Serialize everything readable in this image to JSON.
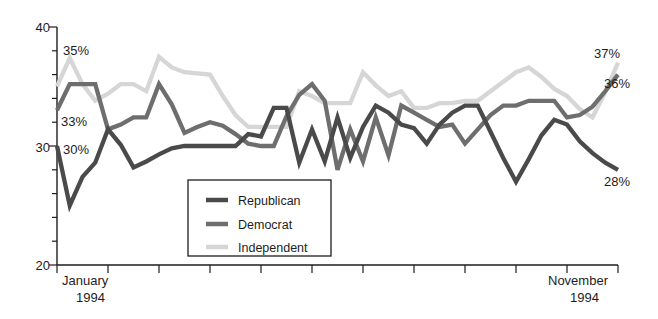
{
  "chart_data": {
    "type": "line",
    "title": "",
    "subtitle": "",
    "xlabel": "",
    "ylabel": "",
    "ylim": [
      20,
      40
    ],
    "y_major_ticks": [
      20,
      30,
      40
    ],
    "y_major_tick_labels": [
      "20",
      "30",
      "40"
    ],
    "y_minor_tick_step": 2,
    "grid": false,
    "legend_position": "inside-bottom-left",
    "x_axis_start_label_line1": "January",
    "x_axis_start_label_line2": "1994",
    "x_axis_end_label_line1": "November",
    "x_axis_end_label_line2": "1994",
    "x_tick_count": 12,
    "x": [
      0,
      1,
      2,
      3,
      4,
      5,
      6,
      7,
      8,
      9,
      10,
      11,
      12,
      13,
      14,
      15,
      16,
      17,
      18,
      19,
      20,
      21,
      22,
      23,
      24,
      25,
      26,
      27,
      28,
      29,
      30,
      31,
      32,
      33,
      34,
      35,
      36,
      37,
      38,
      39,
      40,
      41,
      42,
      43,
      44
    ],
    "series": [
      {
        "name": "Republican",
        "color": "#4a4a4a",
        "start_value": 30,
        "end_value": 28,
        "start_label": "30%",
        "end_label": "28%",
        "values": [
          30,
          25,
          27.4,
          28.6,
          31.4,
          30.1,
          28.2,
          28.7,
          29.3,
          29.8,
          30,
          30,
          30,
          30,
          30,
          31,
          30.8,
          33.2,
          33.2,
          28.6,
          31.4,
          28.7,
          32.4,
          29,
          31.6,
          33.4,
          32.8,
          31.8,
          31.5,
          30.2,
          31.8,
          32.8,
          33.4,
          33.4,
          31.2,
          29,
          27,
          28.9,
          30.9,
          32.2,
          31.8,
          30.4,
          29.4,
          28.6,
          28
        ]
      },
      {
        "name": "Democrat",
        "color": "#6e6e6e",
        "start_value": 33,
        "end_value": 36,
        "start_label": "33%",
        "end_label": "36%",
        "values": [
          33,
          35.2,
          35.2,
          35.2,
          31.4,
          31.8,
          32.4,
          32.4,
          35.2,
          33.5,
          31.1,
          31.6,
          32,
          31.7,
          31,
          30.2,
          30,
          30,
          32.5,
          34.3,
          35.2,
          33.8,
          28,
          31.4,
          28.7,
          32.4,
          29.2,
          33.4,
          32.8,
          32.2,
          31.6,
          31.8,
          30.2,
          31.4,
          32.6,
          33.4,
          33.4,
          33.8,
          33.8,
          33.8,
          32.4,
          32.6,
          33.3,
          34.6,
          36
        ]
      },
      {
        "name": "Independent",
        "color": "#d6d6d6",
        "start_value": 35,
        "end_value": 37,
        "start_label": "35%",
        "end_label": "37%",
        "values": [
          35,
          37.4,
          35.2,
          33.8,
          34.4,
          35.2,
          35.2,
          34.6,
          37.5,
          36.6,
          36.2,
          36.1,
          36,
          34.2,
          32.6,
          31.6,
          31.6,
          31.6,
          31.6,
          34.6,
          34.2,
          33.6,
          33.6,
          33.6,
          36.2,
          35.1,
          34.2,
          34.6,
          33.2,
          33.2,
          33.6,
          33.6,
          33.8,
          33.8,
          34.6,
          35.4,
          36.2,
          36.6,
          35.8,
          34.8,
          34.2,
          33.1,
          32.4,
          34.5,
          37
        ]
      }
    ],
    "annotations": [
      {
        "text": "35%",
        "value": 35,
        "position": "top-left",
        "series": "Independent"
      },
      {
        "text": "33%",
        "value": 33,
        "position": "mid-left",
        "series": "Democrat"
      },
      {
        "text": "30%",
        "value": 30,
        "position": "low-left",
        "series": "Republican"
      },
      {
        "text": "37%",
        "value": 37,
        "position": "top-right",
        "series": "Independent"
      },
      {
        "text": "36%",
        "value": 36,
        "position": "mid-right",
        "series": "Democrat"
      },
      {
        "text": "28%",
        "value": 28,
        "position": "low-right",
        "series": "Republican"
      }
    ]
  },
  "legend": {
    "items": [
      {
        "label": "Republican",
        "color": "#4a4a4a"
      },
      {
        "label": "Democrat",
        "color": "#6e6e6e"
      },
      {
        "label": "Independent",
        "color": "#d6d6d6"
      }
    ]
  }
}
